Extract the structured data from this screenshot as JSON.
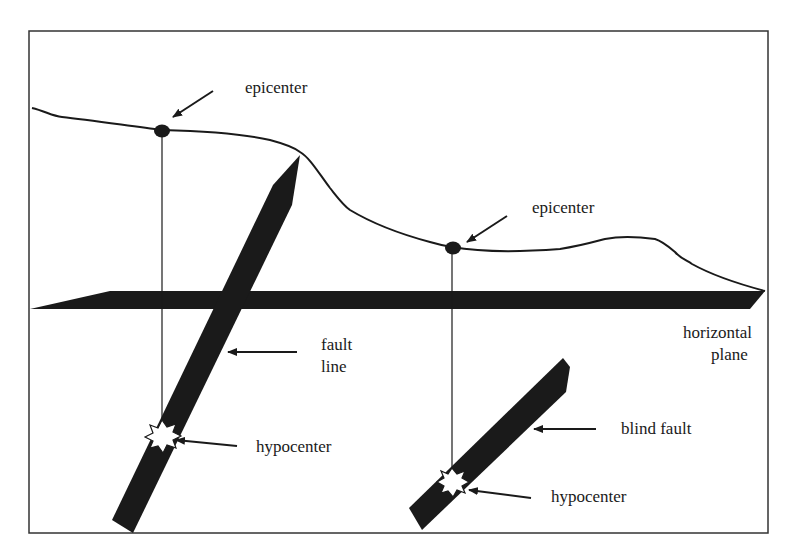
{
  "diagram": {
    "colors": {
      "ink": "#1a1a1a",
      "frame": "#333333",
      "background": "#ffffff"
    },
    "labels": {
      "epicenter_1": "epicenter",
      "epicenter_2": "epicenter",
      "fault_line_1": "fault",
      "fault_line_2": "line",
      "hypocenter_1": "hypocenter",
      "hypocenter_2": "hypocenter",
      "blind_fault": "blind fault",
      "horizontal_plane_1": "horizontal",
      "horizontal_plane_2": "plane"
    },
    "elements": [
      {
        "name": "ground-surface",
        "type": "curve"
      },
      {
        "name": "horizontal-plane",
        "type": "slab"
      },
      {
        "name": "fault-line",
        "type": "slab",
        "reaches_surface": true
      },
      {
        "name": "blind-fault",
        "type": "slab",
        "reaches_surface": false
      },
      {
        "name": "epicenter-1",
        "type": "point",
        "on": "ground-surface"
      },
      {
        "name": "epicenter-2",
        "type": "point",
        "on": "ground-surface"
      },
      {
        "name": "hypocenter-1",
        "type": "burst",
        "on": "fault-line"
      },
      {
        "name": "hypocenter-2",
        "type": "burst",
        "on": "blind-fault"
      }
    ]
  }
}
